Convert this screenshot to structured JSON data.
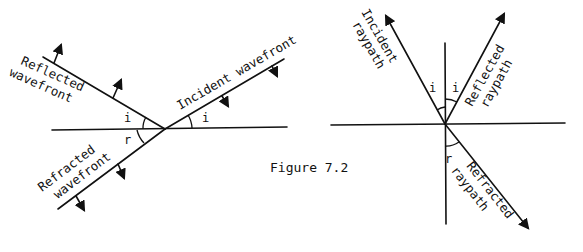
{
  "figure": {
    "caption": "Figure 7.2",
    "left_diagram": {
      "title": "Wavefront diagram",
      "labels": {
        "reflected": [
          "Reflected",
          "wavefront"
        ],
        "incident": "Incident wavefront",
        "refracted": [
          "Refracted",
          "wavefront"
        ]
      },
      "angles": {
        "reflected_angle": "i",
        "incident_angle": "i",
        "refracted_angle": "r"
      }
    },
    "right_diagram": {
      "title": "Raypath diagram",
      "labels": {
        "incident": [
          "Incident",
          "raypath"
        ],
        "reflected": [
          "Reflected",
          "raypath"
        ],
        "refracted": [
          "Refracted",
          "raypath"
        ]
      },
      "angles": {
        "incident_angle": "i",
        "reflected_angle": "i",
        "refracted_angle": "r"
      }
    },
    "colors": {
      "ink": "#111111",
      "background": "#ffffff"
    }
  }
}
